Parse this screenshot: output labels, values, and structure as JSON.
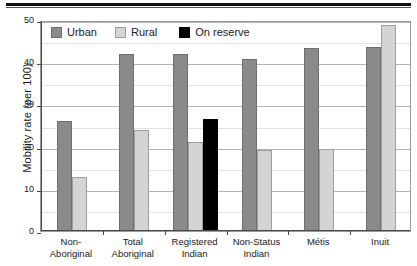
{
  "chart_data": {
    "type": "bar",
    "title": "",
    "xlabel": "",
    "ylabel": "Mobility rate (per 100)",
    "ylim": [
      0,
      50
    ],
    "yticks": [
      0,
      10,
      20,
      30,
      40,
      50
    ],
    "ytick_labels": [
      "0",
      "10",
      "20",
      "30",
      "40",
      "50"
    ],
    "grid": true,
    "legend_position": "top-left",
    "categories": [
      "Non-\nAboriginal",
      "Total\nAboriginal",
      "Registered\nIndian",
      "Non-Status\nIndian",
      "Métis",
      "Inuit"
    ],
    "category_lines": [
      [
        "Non-",
        "Aboriginal"
      ],
      [
        "Total",
        "Aboriginal"
      ],
      [
        "Registered",
        "Indian"
      ],
      [
        "Non-Status",
        "Indian"
      ],
      [
        "Métis",
        ""
      ],
      [
        "Inuit",
        ""
      ]
    ],
    "series": [
      {
        "name": "Urban",
        "color": "#8a8a8a",
        "values": [
          26.0,
          42.0,
          42.0,
          40.8,
          43.3,
          43.5
        ]
      },
      {
        "name": "Rural",
        "color": "#d4d4d4",
        "values": [
          12.7,
          24.0,
          21.2,
          19.3,
          19.5,
          48.8
        ]
      },
      {
        "name": "On reserve",
        "color": "#000000",
        "values": [
          null,
          null,
          26.5,
          null,
          null,
          null
        ]
      }
    ]
  },
  "legend": {
    "items": [
      {
        "label": "Urban",
        "swatch": "urban"
      },
      {
        "label": "Rural",
        "swatch": "rural"
      },
      {
        "label": "On reserve",
        "swatch": "onres"
      }
    ]
  },
  "axes": {
    "y_title": "Mobility rate (per 100)"
  }
}
